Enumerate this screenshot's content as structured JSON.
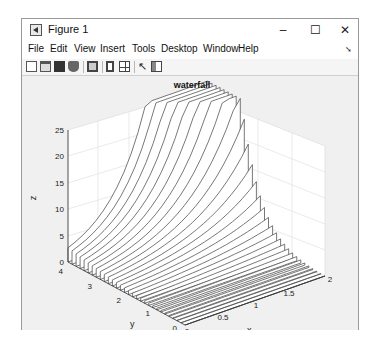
{
  "window": {
    "title": "Figure 1",
    "controls": {
      "minimize": "–",
      "maximize": "☐",
      "close": "✕"
    }
  },
  "menubar": {
    "items": [
      "File",
      "Edit",
      "View",
      "Insert",
      "Tools",
      "Desktop",
      "Window",
      "Help"
    ],
    "overflow_icon": "dock-arrow-icon"
  },
  "toolbar": {
    "buttons": [
      "new-figure-icon",
      "open-file-icon",
      "save-icon",
      "print-icon",
      "link-plot-icon",
      "colorbar-icon",
      "legend-icon",
      "edit-plot-cursor-icon",
      "property-inspector-icon"
    ]
  },
  "chart_data": {
    "type": "waterfall",
    "title": "waterfall",
    "xlabel": "x",
    "ylabel": "y",
    "zlabel": "z",
    "xlim": [
      0,
      2
    ],
    "ylim": [
      0,
      4
    ],
    "zlim": [
      0,
      25
    ],
    "xticks": [
      "0",
      "0.5",
      "1",
      "1.5",
      "2"
    ],
    "yticks": [
      "0",
      "1",
      "2",
      "3",
      "4"
    ],
    "zticks": [
      "0",
      "5",
      "10",
      "15",
      "20",
      "25"
    ],
    "grid": true,
    "series_count": 30,
    "sample_curves": [
      {
        "y": 4,
        "x": [
          0,
          0.5,
          1,
          1.5,
          2
        ],
        "z": [
          2.7,
          4.5,
          7.4,
          12.2,
          20.1
        ]
      },
      {
        "y": 2,
        "x": [
          0,
          0.5,
          1,
          1.5,
          2
        ],
        "z": [
          0.4,
          0.6,
          1.0,
          1.6,
          2.7
        ]
      },
      {
        "y": 0,
        "x": [
          0,
          0.5,
          1,
          1.5,
          2
        ],
        "z": [
          0,
          0,
          0,
          0,
          0
        ]
      }
    ]
  }
}
